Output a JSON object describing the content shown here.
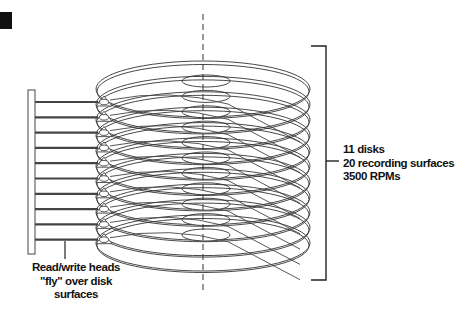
{
  "diagram": {
    "specs_label": {
      "lines": [
        "11 disks",
        "20 recording surfaces",
        "3500 RPMs"
      ]
    },
    "heads_label": {
      "lines": [
        "Read/write heads",
        "\"fly\" over disk",
        "surfaces"
      ]
    },
    "disk_count": 11,
    "arm_count": 10,
    "colors": {
      "line": "#333333",
      "background": "#ffffff",
      "corner_block": "#111111"
    }
  }
}
